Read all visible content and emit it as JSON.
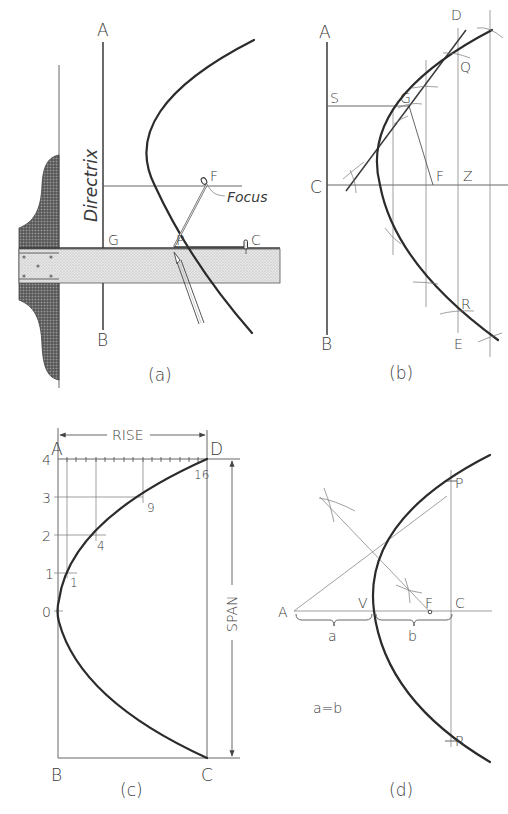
{
  "figure": {
    "colors": {
      "ink": "#2b2b2b",
      "construction": "#666666",
      "stipple": "#d8d8d8",
      "hatch": "#555555",
      "background": "#ffffff"
    }
  },
  "panels": {
    "a": {
      "caption": "(a)",
      "title": "Parabola drawn with T-square, string and pencil",
      "labels": {
        "A": "A",
        "B": "B",
        "G": "G",
        "P": "P",
        "F": "F",
        "C": "C"
      },
      "directrix_label": "Directrix",
      "focus_label": "Focus"
    },
    "b": {
      "caption": "(b)",
      "title": "Parabola by directrix-focus construction with tangent",
      "labels": {
        "A": "A",
        "B": "B",
        "C": "C",
        "S": "S",
        "G": "G",
        "F": "F",
        "Z": "Z",
        "D": "D",
        "Q": "Q",
        "R": "R",
        "E": "E"
      }
    },
    "c": {
      "caption": "(c)",
      "title": "Parabola by offset method in rectangle",
      "labels": {
        "A": "A",
        "D": "D",
        "B": "B",
        "C": "C"
      },
      "dimensions": {
        "rise": "RISE",
        "span": "SPAN"
      },
      "row_numbers": [
        "4",
        "3",
        "2",
        "1",
        "0"
      ],
      "offset_numbers": [
        "16",
        "9",
        "4",
        "1"
      ]
    },
    "d": {
      "caption": "(d)",
      "title": "Finding focus of a given parabola",
      "labels": {
        "A": "A",
        "V": "V",
        "F": "F",
        "C": "C",
        "P": "P",
        "R": "R"
      },
      "brace_labels": {
        "a": "a",
        "b": "b"
      },
      "equation": "a=b"
    }
  }
}
